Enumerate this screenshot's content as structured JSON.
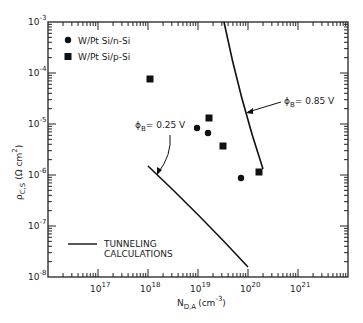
{
  "chart_data": {
    "type": "scatter",
    "title": "",
    "xlabel": "N_D,A (cm^-3)",
    "ylabel": "ρ_C,S (Ω cm^2)",
    "xscale": "log",
    "yscale": "log",
    "xlim": [
      1e+16,
      1e+22
    ],
    "ylim": [
      1e-08,
      0.001
    ],
    "x_tick_labels": [
      "10^17",
      "10^18",
      "10^19",
      "10^20",
      "10^21"
    ],
    "y_tick_labels": [
      "10^-3",
      "10^-4",
      "10^-5",
      "10^-6",
      "10^-7",
      "10^-8"
    ],
    "grid": false,
    "legend_position": "upper left",
    "series": [
      {
        "name": "W/Pt Si/n-Si",
        "marker": "circle",
        "x": [
          9.5e+18,
          1.6e+19,
          7.2e+19
        ],
        "y": [
          8.3e-06,
          6.6e-06,
          8.7e-07
        ]
      },
      {
        "name": "W/Pt Si/p-Si",
        "marker": "square",
        "x": [
          1.1e+18,
          1.7e+19,
          3.2e+19,
          1.7e+20
        ],
        "y": [
          7.6e-05,
          1.3e-05,
          3.7e-06,
          1.1e-06
        ]
      },
      {
        "name": "Tunneling calculations φB=0.85 V",
        "marker": "line",
        "x": [
          5.6e+19,
          7.5e+19,
          1e+20,
          1.3e+20,
          1.6e+20
        ],
        "y": [
          0.001,
          0.0001,
          1.5e-05,
          3e-06,
          1.2e-06
        ]
      },
      {
        "name": "Tunneling calculations φB=0.25 V",
        "marker": "line",
        "x": [
          1e+18,
          3e+18,
          1e+19,
          3e+19,
          1e+20
        ],
        "y": [
          1.5e-06,
          4e-07,
          1e-07,
          3e-08,
          1.1e-08
        ]
      }
    ],
    "annotations": [
      "φB = 0.85 V",
      "φB = 0.25 V"
    ]
  },
  "labels": {
    "legend_n": "W/Pt Si/n-Si",
    "legend_p": "W/Pt Si/p-Si",
    "tunnel1": "TUNNELING",
    "tunnel2": "CALCULATIONS",
    "phi085": "= 0.85 V",
    "phi025": "= 0.25 V",
    "xlabel": "N",
    "xlabel_sub": "D,A",
    "xlabel_unit": "(cm",
    "xlabel_exp": "-3",
    "ylabel": "ρ",
    "ylabel_sub": "C,S",
    "ylabel_unit": "(Ω cm",
    "xt": [
      "10",
      "10",
      "10",
      "10",
      "10"
    ],
    "xt_exp": [
      "17",
      "18",
      "19",
      "20",
      "21"
    ],
    "yt_exp": [
      "-3",
      "-4",
      "-5",
      "-6",
      "-7",
      "-8"
    ]
  }
}
